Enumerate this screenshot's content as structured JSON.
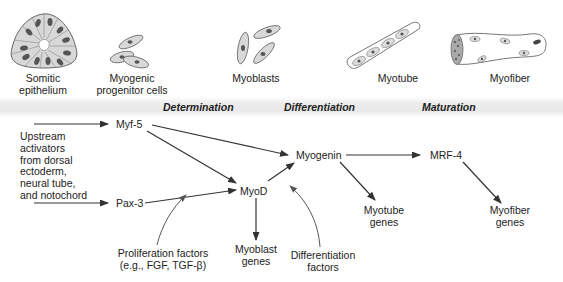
{
  "cells": [
    {
      "id": "somitic-epithelium",
      "label": "Somitic\nepithelium"
    },
    {
      "id": "myogenic-progenitor",
      "label": "Myogenic\nprogenitor cells"
    },
    {
      "id": "myoblasts",
      "label": "Myoblasts"
    },
    {
      "id": "myotube",
      "label": "Myotube"
    },
    {
      "id": "myofiber",
      "label": "Myofiber"
    }
  ],
  "stages": [
    {
      "label": "Determination"
    },
    {
      "label": "Differentiation"
    },
    {
      "label": "Maturation"
    }
  ],
  "upstream_text": "Upstream\nactivators\nfrom dorsal\nectoderm,\nneural tube,\nand notochord",
  "nodes": {
    "myf5": "Myf-5",
    "pax3": "Pax-3",
    "myod": "MyoD",
    "myogenin": "Myogenin",
    "mrf4": "MRF-4"
  },
  "outputs": {
    "myoblast_genes": "Myoblast\ngenes",
    "myotube_genes": "Myotube\ngenes",
    "myofiber_genes": "Myofiber\ngenes"
  },
  "factors": {
    "proliferation": "Proliferation factors\n(e.g., FGF, TGF-β)",
    "differentiation": "Differentiation\nfactors"
  },
  "edges": [
    {
      "from": "upstream",
      "to": "myf5"
    },
    {
      "from": "upstream",
      "to": "pax3"
    },
    {
      "from": "myf5",
      "to": "myogenin"
    },
    {
      "from": "myf5",
      "to": "myod"
    },
    {
      "from": "pax3",
      "to": "myod"
    },
    {
      "from": "myod",
      "to": "myogenin"
    },
    {
      "from": "myod",
      "to": "myoblast_genes"
    },
    {
      "from": "myogenin",
      "to": "mrf4"
    },
    {
      "from": "myogenin",
      "to": "myotube_genes"
    },
    {
      "from": "mrf4",
      "to": "myofiber_genes"
    },
    {
      "from": "proliferation",
      "to": "myod"
    },
    {
      "from": "differentiation",
      "to": "myogenin"
    }
  ]
}
